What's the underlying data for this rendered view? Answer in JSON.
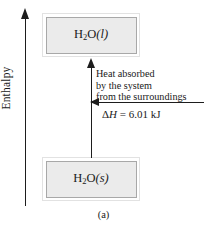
{
  "figure": {
    "caption": "(a)",
    "axis": {
      "label": "Enthalpy",
      "direction": "up"
    },
    "states": {
      "upper": {
        "formula": "H",
        "subscript": "2",
        "element": "O",
        "phase": "(l)",
        "full_text": "H2O(l)"
      },
      "lower": {
        "formula": "H",
        "subscript": "2",
        "element": "O",
        "phase": "(s)",
        "full_text": "H2O(s)"
      }
    },
    "process": {
      "annotation_lines": [
        "Heat absorbed",
        "by the system",
        "from the surroundings"
      ],
      "delta_symbol": "Δ",
      "delta_variable": "H",
      "delta_value": " = 6.01 kJ",
      "delta_full": "ΔH = 6.01 kJ"
    }
  },
  "colors": {
    "ink": "#1d1d1d",
    "box_fill": "#ebebeb",
    "box_border": "#a8a8a8",
    "box_outer": "#e2e2e2",
    "background": "#ffffff"
  }
}
